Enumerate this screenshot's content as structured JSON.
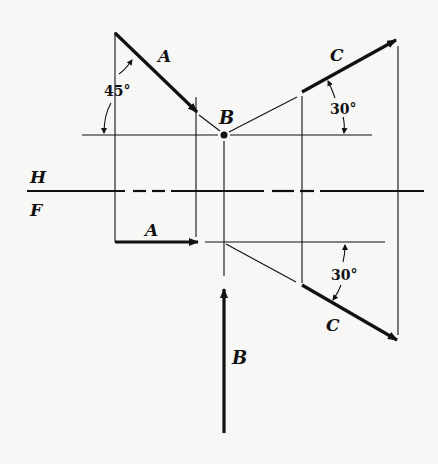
{
  "diagram": {
    "type": "orthographic-projection",
    "views": [
      "top (H)",
      "front (F)"
    ],
    "ink_color": "#111111",
    "background_color": "#f7f7f5",
    "reference_plane": {
      "top_label": "H",
      "bottom_label": "F"
    },
    "top_view": {
      "vector_a": {
        "label": "A",
        "angle_label": "45°"
      },
      "point_b": {
        "label": "B"
      },
      "vector_c": {
        "label": "C",
        "angle_label": "30°"
      }
    },
    "front_view": {
      "vector_a": {
        "label": "A"
      },
      "vector_b": {
        "label": "B"
      },
      "vector_c": {
        "label": "C",
        "angle_label": "30°"
      }
    }
  }
}
